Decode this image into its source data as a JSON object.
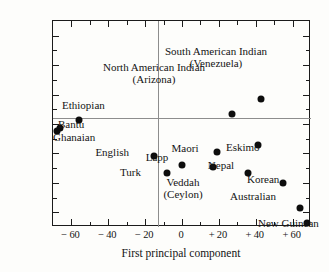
{
  "chart_data": {
    "type": "scatter",
    "title": "",
    "xlabel": "First principal component",
    "ylabel": "Second principal component",
    "xlim": [
      -70,
      70
    ],
    "ylim": [
      -70,
      70
    ],
    "grid": false,
    "legend": "none",
    "zero_lines": true,
    "xticks": [
      "− 60",
      "− 40",
      "− 20",
      "0",
      "+ 20",
      "+ 40",
      "+ 60"
    ],
    "xtick_values": [
      -60,
      -40,
      -20,
      0,
      20,
      40,
      60
    ],
    "yticks": [
      "+ 60",
      "+ 40",
      "+ 20",
      "0",
      "− 20",
      "− 40",
      "− 60"
    ],
    "ytick_values": [
      60,
      40,
      20,
      0,
      -20,
      -40,
      -60
    ],
    "minor_tick_values": [
      -50,
      -30,
      -10,
      10,
      30,
      50
    ],
    "points": [
      {
        "label": "Ethiopian",
        "x": -56,
        "y": 3,
        "lx": 62,
        "ly": 100,
        "align": "left"
      },
      {
        "label": "Bantu",
        "x": -66,
        "y": -3,
        "lx": 58,
        "ly": 119,
        "align": "left"
      },
      {
        "label": "Ghanaian",
        "x": -68,
        "y": -5,
        "lx": 53,
        "ly": 132,
        "align": "left"
      },
      {
        "label": "English",
        "x": -15,
        "y": -22,
        "lx": 129,
        "ly": 147,
        "align": "right"
      },
      {
        "label": "Turk",
        "x": -8,
        "y": -33,
        "lx": 141,
        "ly": 167,
        "align": "right"
      },
      {
        "label": "Lapp",
        "x": 0,
        "y": -28,
        "lx": 157,
        "ly": 152,
        "align": "center"
      },
      {
        "label": "Maori",
        "x": 19,
        "y": -19,
        "lx": 185,
        "ly": 143,
        "align": "center"
      },
      {
        "label": "Veddah\n(Ceylon)",
        "x": 17,
        "y": -29,
        "lx": 183,
        "ly": 177,
        "align": "center"
      },
      {
        "label": "Nepal",
        "x": 36,
        "y": -33,
        "lx": 221,
        "ly": 160,
        "align": "center"
      },
      {
        "label": "Eskimo",
        "x": 41,
        "y": -14,
        "lx": 226,
        "ly": 142,
        "align": "left"
      },
      {
        "label": "Korean",
        "x": 55,
        "y": -40,
        "lx": 247,
        "ly": 174,
        "align": "left"
      },
      {
        "label": "Australian",
        "x": 64,
        "y": -57,
        "lx": 253,
        "ly": 191,
        "align": "center"
      },
      {
        "label": "New Guinean",
        "x": 68,
        "y": -67,
        "lx": 258,
        "ly": 218,
        "align": "left"
      },
      {
        "label": "North American Indian\n(Arizona)",
        "x": 27,
        "y": 7,
        "lx": 154,
        "ly": 62,
        "align": "center"
      },
      {
        "label": "South American Indian\n(Venezuela)",
        "x": 43,
        "y": 17,
        "lx": 216,
        "ly": 46,
        "align": "center"
      }
    ]
  }
}
